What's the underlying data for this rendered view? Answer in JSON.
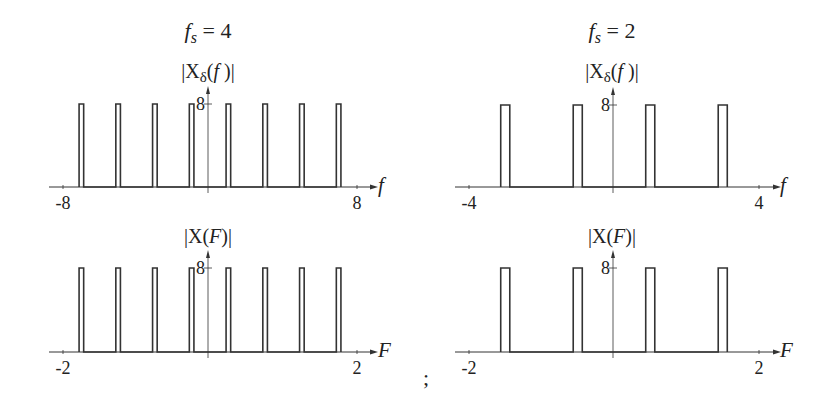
{
  "figure": {
    "separator": ";",
    "columns": [
      {
        "title_var": "f",
        "title_sub": "s",
        "title_eq": "= 4",
        "fs": 4
      },
      {
        "title_var": "f",
        "title_sub": "s",
        "title_eq": "= 2",
        "fs": 2
      }
    ]
  },
  "chart_data": [
    {
      "type": "bar",
      "title": "|Xδ(f)|",
      "column_title": "fs = 4",
      "xlabel": "f",
      "ylabel": "",
      "xlim": [
        -8,
        8
      ],
      "ylim": [
        0,
        8
      ],
      "xticks": [
        "-8",
        "8"
      ],
      "yticks": [
        "8"
      ],
      "pulse_width": 0.25,
      "pulse_centers": [
        -7,
        -5,
        -3,
        -1,
        1,
        3,
        5,
        7
      ],
      "values": [
        8,
        8,
        8,
        8,
        8,
        8,
        8,
        8
      ],
      "grid": false
    },
    {
      "type": "bar",
      "title": "|X(F)|",
      "column_title": "fs = 4",
      "xlabel": "F",
      "ylabel": "",
      "xlim": [
        -2,
        2
      ],
      "ylim": [
        0,
        8
      ],
      "xticks": [
        "-2",
        "2"
      ],
      "yticks": [
        "8"
      ],
      "pulse_width": 0.0625,
      "pulse_centers": [
        -1.75,
        -1.25,
        -0.75,
        -0.25,
        0.25,
        0.75,
        1.25,
        1.75
      ],
      "values": [
        8,
        8,
        8,
        8,
        8,
        8,
        8,
        8
      ],
      "grid": false
    },
    {
      "type": "bar",
      "title": "|Xδ(f)|",
      "column_title": "fs = 2",
      "xlabel": "f",
      "ylabel": "",
      "xlim": [
        -4,
        4
      ],
      "ylim": [
        0,
        8
      ],
      "xticks": [
        "-4",
        "4"
      ],
      "yticks": [
        "8"
      ],
      "pulse_width": 0.25,
      "pulse_centers": [
        -3,
        -1,
        1,
        3
      ],
      "values": [
        8,
        8,
        8,
        8
      ],
      "grid": false
    },
    {
      "type": "bar",
      "title": "|X(F)|",
      "column_title": "fs = 2",
      "xlabel": "F",
      "ylabel": "",
      "xlim": [
        -2,
        2
      ],
      "ylim": [
        0,
        8
      ],
      "xticks": [
        "-2",
        "2"
      ],
      "yticks": [
        "8"
      ],
      "pulse_width": 0.125,
      "pulse_centers": [
        -1.5,
        -0.5,
        0.5,
        1.5
      ],
      "values": [
        8,
        8,
        8,
        8
      ],
      "grid": false
    }
  ],
  "layout": {
    "panels": [
      {
        "x0": 63,
        "x1": 357,
        "yaxis_x": 208,
        "base_y": 187,
        "top_y": 104,
        "arrow_end": 372,
        "title_x": 208,
        "title_y": 78,
        "label_x": 378,
        "label_y": 192
      },
      {
        "x0": 63,
        "x1": 357,
        "yaxis_x": 208,
        "base_y": 352,
        "top_y": 268,
        "arrow_end": 372,
        "title_x": 208,
        "title_y": 243,
        "label_x": 378,
        "label_y": 357
      },
      {
        "x0": 469,
        "x1": 759,
        "yaxis_x": 613,
        "base_y": 187,
        "top_y": 105,
        "arrow_end": 775,
        "title_x": 612,
        "title_y": 78,
        "label_x": 780,
        "label_y": 192
      },
      {
        "x0": 469,
        "x1": 759,
        "yaxis_x": 613,
        "base_y": 352,
        "top_y": 268,
        "arrow_end": 775,
        "title_x": 612,
        "title_y": 243,
        "label_x": 780,
        "label_y": 357
      }
    ],
    "column_title_pos": [
      {
        "x": 208,
        "y": 38
      },
      {
        "x": 612,
        "y": 38
      }
    ],
    "separator_pos": {
      "x": 423,
      "y": 385
    },
    "stroke": "#333333"
  }
}
